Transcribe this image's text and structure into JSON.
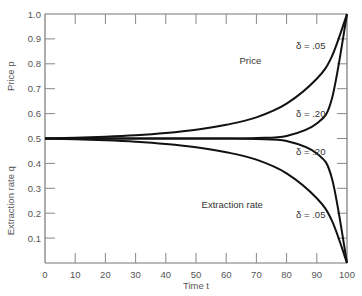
{
  "chart_data": {
    "type": "line",
    "title": "",
    "xlabel": "Time t",
    "ylabel_top": "Price p",
    "ylabel_bottom": "Extraction rate q",
    "xlim": [
      0,
      100
    ],
    "ylim": [
      0,
      1.0
    ],
    "x_ticks": [
      0,
      10,
      20,
      30,
      40,
      50,
      60,
      70,
      80,
      90,
      100
    ],
    "y_ticks": [
      "0.1",
      "0.2",
      "0.3",
      "0.4",
      "0.5",
      "0.6",
      "0.7",
      "0.8",
      "0.9",
      "1.0"
    ],
    "grid": false,
    "x": [
      0,
      10,
      20,
      30,
      40,
      50,
      60,
      70,
      80,
      90,
      95,
      100
    ],
    "series": [
      {
        "name": "Price, δ = .05",
        "values": [
          0.5,
          0.503,
          0.507,
          0.513,
          0.522,
          0.535,
          0.555,
          0.585,
          0.64,
          0.74,
          0.83,
          1.0
        ]
      },
      {
        "name": "Price, δ = .20",
        "values": [
          0.5,
          0.5,
          0.5,
          0.5,
          0.5,
          0.5,
          0.5,
          0.502,
          0.51,
          0.56,
          0.66,
          1.0
        ]
      },
      {
        "name": "Extraction rate, δ = .20",
        "values": [
          0.5,
          0.5,
          0.5,
          0.5,
          0.5,
          0.5,
          0.5,
          0.498,
          0.49,
          0.44,
          0.34,
          0.0
        ]
      },
      {
        "name": "Extraction rate, δ = .05",
        "values": [
          0.5,
          0.497,
          0.493,
          0.487,
          0.478,
          0.465,
          0.445,
          0.415,
          0.36,
          0.26,
          0.17,
          0.0
        ]
      }
    ],
    "annotations": [
      {
        "text": "Price",
        "x": 68,
        "y": 0.8
      },
      {
        "text": "δ = .05",
        "x": 88,
        "y": 0.86
      },
      {
        "text": "δ = .20",
        "x": 88,
        "y": 0.585
      },
      {
        "text": "δ = .20",
        "x": 88,
        "y": 0.435
      },
      {
        "text": "Extraction rate",
        "x": 62,
        "y": 0.22
      },
      {
        "text": "δ = .05",
        "x": 88,
        "y": 0.18
      }
    ]
  }
}
